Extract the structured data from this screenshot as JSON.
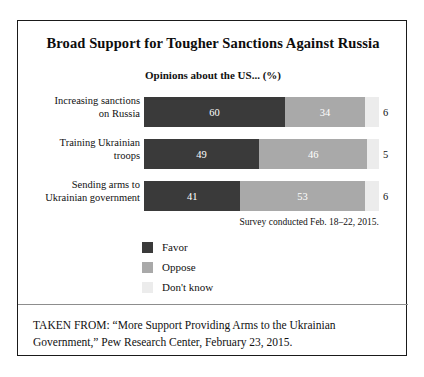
{
  "figure": {
    "title": "Broad Support for Tougher Sanctions Against Russia",
    "subtitle": "Opinions about the US... (%)",
    "survey_note": "Survey conducted Feb. 18–22, 2015.",
    "footer_line1": "TAKEN FROM: “More Support Providing Arms to the Ukrainian",
    "footer_line2": "Government,” Pew Research Center, February 23, 2015."
  },
  "colors": {
    "favor": "#3a3a3a",
    "oppose": "#a9a9a9",
    "dont_know": "#ececec",
    "frame": "#1a1a1a",
    "text": "#111111",
    "divider": "#8d8d8d",
    "background": "#ffffff"
  },
  "legend": {
    "items": [
      {
        "label": "Favor",
        "color": "#3a3a3a"
      },
      {
        "label": "Oppose",
        "color": "#a9a9a9"
      },
      {
        "label": "Don't know",
        "color": "#ececec"
      }
    ]
  },
  "chart_data": {
    "type": "bar",
    "orientation": "horizontal",
    "stacked": true,
    "stacked_total": 100,
    "title": "Broad Support for Tougher Sanctions Against Russia",
    "subtitle": "Opinions about the US... (%)",
    "xlabel": "",
    "ylabel": "",
    "xlim": [
      0,
      100
    ],
    "grid": false,
    "legend_position": "bottom-left",
    "value_unit": "%",
    "annotation": "Survey conducted Feb. 18–22, 2015.",
    "categories": [
      "Increasing sanctions on Russia",
      "Training Ukrainian troops",
      "Sending arms to Ukrainian government"
    ],
    "category_lines": [
      [
        "Increasing sanctions",
        "on Russia"
      ],
      [
        "Training Ukrainian",
        "troops"
      ],
      [
        "Sending arms to",
        "Ukrainian government"
      ]
    ],
    "series": [
      {
        "name": "Favor",
        "color": "#3a3a3a",
        "values": [
          60,
          49,
          41
        ]
      },
      {
        "name": "Oppose",
        "color": "#a9a9a9",
        "values": [
          34,
          46,
          53
        ]
      },
      {
        "name": "Don't know",
        "color": "#ececec",
        "values": [
          6,
          5,
          6
        ]
      }
    ],
    "rows": [
      {
        "category_line1": "Increasing sanctions",
        "category_line2": "on Russia",
        "favor": 60,
        "oppose": 34,
        "dont_know": 6,
        "favor_label": "60",
        "oppose_label": "34",
        "dont_know_label": "6"
      },
      {
        "category_line1": "Training Ukrainian",
        "category_line2": "troops",
        "favor": 49,
        "oppose": 46,
        "dont_know": 5,
        "favor_label": "49",
        "oppose_label": "46",
        "dont_know_label": "5"
      },
      {
        "category_line1": "Sending arms to",
        "category_line2": "Ukrainian government",
        "favor": 41,
        "oppose": 53,
        "dont_know": 6,
        "favor_label": "41",
        "oppose_label": "53",
        "dont_know_label": "6"
      }
    ]
  }
}
